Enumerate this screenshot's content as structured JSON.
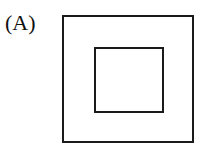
{
  "figure": {
    "label": "(A)",
    "shapes": [
      {
        "type": "square",
        "role": "outer"
      },
      {
        "type": "square",
        "role": "inner"
      }
    ]
  }
}
